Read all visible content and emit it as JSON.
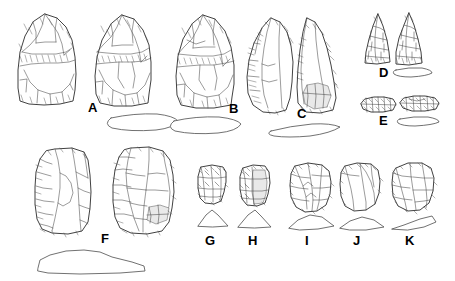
{
  "figure": {
    "kind": "archaeological-lithic-illustration",
    "background_color": "#ffffff",
    "ink_color": "#2b2b2b",
    "width": 455,
    "height": 281,
    "rows": 2
  },
  "labels": {
    "a": "A",
    "b": "B",
    "c": "C",
    "d": "D",
    "e": "E",
    "f": "F",
    "g": "G",
    "h": "H",
    "i": "I",
    "j": "J",
    "k": "K"
  },
  "artifacts": [
    {
      "label": "A",
      "row": 1,
      "views": 2,
      "has_profile": true,
      "profile_shape": "flat-lenticular",
      "form": "ovate-biface-handaxe",
      "label_x": 88,
      "label_y": 101
    },
    {
      "label": "B",
      "row": 1,
      "views": 1,
      "has_profile": true,
      "profile_shape": "flat-lenticular",
      "form": "ovate-biface-handaxe",
      "label_x": 229,
      "label_y": 102
    },
    {
      "label": "C",
      "row": 1,
      "views": 2,
      "has_profile": true,
      "profile_shape": "teardrop-plano-convex",
      "form": "pointed-biface",
      "label_x": 297,
      "label_y": 107
    },
    {
      "label": "D",
      "row": 1,
      "views": 2,
      "has_profile": true,
      "profile_shape": "narrow-lenticular",
      "form": "triangular-projectile-point",
      "label_x": 379,
      "label_y": 66
    },
    {
      "label": "E",
      "row": 1,
      "views": 2,
      "has_profile": true,
      "profile_shape": "narrow-lenticular",
      "form": "retouched-blade-segment",
      "label_x": 379,
      "label_y": 114
    },
    {
      "label": "F",
      "row": 2,
      "views": 2,
      "has_profile": true,
      "profile_shape": "broad-plano-convex",
      "form": "large-flake-core",
      "label_x": 101,
      "label_y": 232
    },
    {
      "label": "G",
      "row": 2,
      "views": 1,
      "has_profile": true,
      "profile_shape": "triangular",
      "form": "end-scraper",
      "label_x": 205,
      "label_y": 234
    },
    {
      "label": "H",
      "row": 2,
      "views": 1,
      "has_profile": true,
      "profile_shape": "triangular",
      "form": "end-scraper",
      "label_x": 248,
      "label_y": 234
    },
    {
      "label": "I",
      "row": 2,
      "views": 1,
      "has_profile": true,
      "profile_shape": "low-triangular",
      "form": "side-scraper",
      "label_x": 305,
      "label_y": 234
    },
    {
      "label": "J",
      "row": 2,
      "views": 1,
      "has_profile": true,
      "profile_shape": "low-wedge",
      "form": "side-scraper",
      "label_x": 353,
      "label_y": 234
    },
    {
      "label": "K",
      "row": 2,
      "views": 1,
      "has_profile": true,
      "profile_shape": "wedge",
      "form": "side-scraper",
      "label_x": 405,
      "label_y": 234
    }
  ]
}
